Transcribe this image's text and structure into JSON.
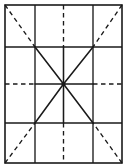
{
  "figure": {
    "title": "Grid with radiating star diagram",
    "canvas": {
      "width": 128,
      "height": 168,
      "background": "#ffffff"
    },
    "frame": {
      "label": "Outer rectangle border",
      "x": 5,
      "y": 5,
      "width": 117,
      "height": 158,
      "stroke": "#1a1a1a",
      "stroke_width": 1.6,
      "style": "solid"
    },
    "colors": {
      "stroke": "#1a1a1a",
      "background": "#ffffff"
    },
    "center_point": {
      "label": "Center convergence node",
      "x": 63.5,
      "y": 84,
      "radius": 2.1
    },
    "grid": {
      "label": "Interior grid lines",
      "vertical_x": [
        35,
        63.5,
        93
      ],
      "horizontal_y": [
        47,
        84,
        123
      ],
      "stroke_width": 1.3
    },
    "lines": [
      {
        "name": "vertical-left",
        "orientation": "vertical",
        "x": 35,
        "y1": 5,
        "y2": 163,
        "style": "solid"
      },
      {
        "name": "vertical-center",
        "orientation": "vertical",
        "x": 63.5,
        "y1": 5,
        "y2": 163,
        "style": "dashed-outer-solid-inner"
      },
      {
        "name": "vertical-right",
        "orientation": "vertical",
        "x": 93,
        "y1": 5,
        "y2": 163,
        "style": "solid"
      },
      {
        "name": "horizontal-upper",
        "orientation": "horizontal",
        "y": 47,
        "x1": 5,
        "x2": 122,
        "style": "solid"
      },
      {
        "name": "horizontal-center",
        "orientation": "horizontal",
        "y": 84,
        "x1": 5,
        "x2": 122,
        "style": "dashed-outer-solid-inner"
      },
      {
        "name": "horizontal-lower",
        "orientation": "horizontal",
        "y": 123,
        "x1": 5,
        "x2": 122,
        "style": "solid"
      }
    ],
    "diagonals": [
      {
        "name": "diagonal-nw",
        "from_corner": "top-left",
        "dashed_from": [
          5,
          5
        ],
        "dashed_to": [
          35,
          47
        ],
        "solid_to": [
          63.5,
          84
        ]
      },
      {
        "name": "diagonal-ne",
        "from_corner": "top-right",
        "dashed_from": [
          122,
          5
        ],
        "dashed_to": [
          93,
          47
        ],
        "solid_to": [
          63.5,
          84
        ]
      },
      {
        "name": "diagonal-sw",
        "from_corner": "bottom-left",
        "dashed_from": [
          5,
          163
        ],
        "dashed_to": [
          35,
          123
        ],
        "solid_to": [
          63.5,
          84
        ]
      },
      {
        "name": "diagonal-se",
        "from_corner": "bottom-right",
        "dashed_from": [
          122,
          163
        ],
        "dashed_to": [
          93,
          123
        ],
        "solid_to": [
          63.5,
          84
        ]
      }
    ],
    "center_spokes_solid": [
      {
        "name": "spoke-up",
        "to": [
          63.5,
          47
        ]
      },
      {
        "name": "spoke-down",
        "to": [
          63.5,
          123
        ]
      },
      {
        "name": "spoke-left",
        "to": [
          35,
          84
        ]
      },
      {
        "name": "spoke-right",
        "to": [
          93,
          84
        ]
      }
    ],
    "dash_pattern": {
      "dash": 4.5,
      "gap": 3.5
    }
  }
}
